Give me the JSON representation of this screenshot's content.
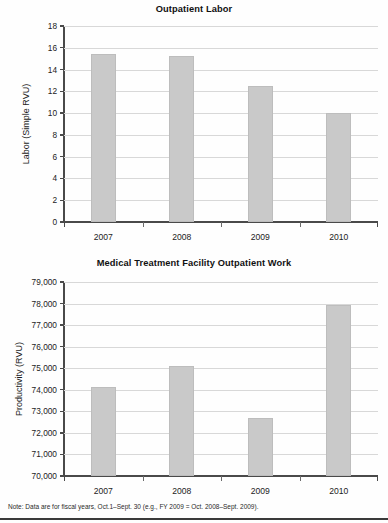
{
  "figure": {
    "footnote": "Note: Data are for fiscal years, Oct.1–Sept. 30 (e.g., FY 2009 = Oct. 2008–Sept. 2009).",
    "bar_color": "#c9c9c9",
    "bar_border_color": "#bdbdbd",
    "grid_color": "#d8d8d8",
    "axis_color": "#4a4a4a"
  },
  "chart_data": [
    {
      "id": "outpatient-labor",
      "type": "bar",
      "title": "Outpatient Labor",
      "xlabel": "",
      "ylabel": "Labor (Simple RVU)",
      "categories": [
        "2007",
        "2008",
        "2009",
        "2010"
      ],
      "values": [
        15.4,
        15.2,
        12.5,
        10.0
      ],
      "ylim": [
        0,
        18
      ],
      "yticks": [
        0,
        2,
        4,
        6,
        8,
        10,
        12,
        14,
        16,
        18
      ],
      "ytick_labels": [
        "0",
        "2",
        "4",
        "6",
        "8",
        "10",
        "12",
        "14",
        "16",
        "18"
      ],
      "grid": true,
      "legend": "none"
    },
    {
      "id": "mtf-outpatient-work",
      "type": "bar",
      "title": "Medical Treatment Facility Outpatient Work",
      "xlabel": "",
      "ylabel": "Productivity (RVU)",
      "categories": [
        "2007",
        "2008",
        "2009",
        "2010"
      ],
      "values": [
        74150,
        75100,
        72680,
        77950
      ],
      "ylim": [
        70000,
        79000
      ],
      "yticks": [
        70000,
        71000,
        72000,
        73000,
        74000,
        75000,
        76000,
        77000,
        78000,
        79000
      ],
      "ytick_labels": [
        "70,000",
        "71,000",
        "72,000",
        "73,000",
        "74,000",
        "75,000",
        "76,000",
        "77,000",
        "78,000",
        "79,000"
      ],
      "grid": true,
      "legend": "none"
    }
  ]
}
